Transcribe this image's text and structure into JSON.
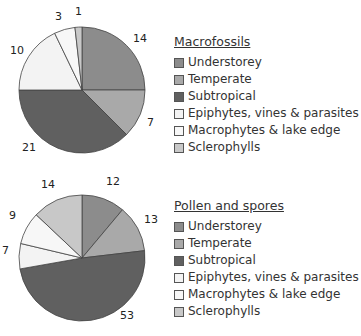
{
  "chart_data": [
    {
      "type": "pie",
      "title": "Macrofossils",
      "categories": [
        "Understorey",
        "Temperate",
        "Subtropical",
        "Epiphytes, vines & parasites",
        "Macrophytes & lake edge",
        "Sclerophylls"
      ],
      "values": [
        14,
        7,
        21,
        10,
        3,
        1
      ],
      "colors": [
        "#8c8c8c",
        "#a9a9a9",
        "#606060",
        "#f3f3f3",
        "#f7f7f7",
        "#c8c8c8"
      ],
      "legend_position": "right"
    },
    {
      "type": "pie",
      "title": "Pollen and spores",
      "categories": [
        "Understorey",
        "Temperate",
        "Subtropical",
        "Epiphytes, vines & parasites",
        "Macrophytes & lake edge",
        "Sclerophylls"
      ],
      "values": [
        12,
        13,
        53,
        7,
        9,
        14
      ],
      "colors": [
        "#8c8c8c",
        "#a9a9a9",
        "#606060",
        "#f3f3f3",
        "#f7f7f7",
        "#c8c8c8"
      ],
      "legend_position": "right"
    }
  ],
  "charts": [
    {
      "title": "Macrofossils",
      "labels": [
        "14",
        "7",
        "21",
        "10",
        "3",
        "1"
      ],
      "legend": [
        "Understorey",
        "Temperate",
        "Subtropical",
        "Epiphytes, vines & parasites",
        "Macrophytes & lake edge",
        "Sclerophylls"
      ]
    },
    {
      "title": "Pollen and spores",
      "labels": [
        "12",
        "13",
        "53",
        "7",
        "9",
        "14"
      ],
      "legend": [
        "Understorey",
        "Temperate",
        "Subtropical",
        "Epiphytes, vines & parasites",
        "Macrophytes & lake edge",
        "Sclerophylls"
      ]
    }
  ]
}
